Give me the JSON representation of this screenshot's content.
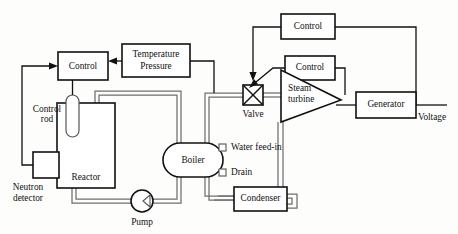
{
  "diagram": {
    "canvas": {
      "width": 458,
      "height": 234
    },
    "colors": {
      "background": "#fdfdfc",
      "line": "#111111",
      "pipe": "#6f6f6f",
      "fill": "#ffffff"
    },
    "nodes": {
      "control_reactor": {
        "label": "Control",
        "shape": "rectangle"
      },
      "temperature_pressure": {
        "label": "Temperature\nPressure",
        "line1": "Temperature",
        "line2": "Pressure",
        "shape": "rectangle"
      },
      "control_top": {
        "label": "Control",
        "shape": "rectangle"
      },
      "control_valve": {
        "label": "Control",
        "shape": "rectangle"
      },
      "reactor": {
        "label": "Reactor",
        "shape": "rectangle"
      },
      "control_rod": {
        "label": "Control\nrod",
        "line1": "Control",
        "line2": "rod",
        "shape": "rounded-rod"
      },
      "neutron_detector": {
        "label": "Neutron\ndetector",
        "line1": "Neutron",
        "line2": "detector",
        "shape": "rectangle"
      },
      "pump": {
        "label": "Pump",
        "shape": "circle"
      },
      "boiler": {
        "label": "Boiler",
        "shape": "stadium"
      },
      "valve": {
        "label": "Valve",
        "shape": "square-with-x"
      },
      "steam_turbine": {
        "label": "Steam\nturbine",
        "line1": "Steam",
        "line2": "turbine",
        "shape": "triangle"
      },
      "generator": {
        "label": "Generator",
        "shape": "rectangle"
      },
      "condenser": {
        "label": "Condenser",
        "shape": "rectangle"
      },
      "water_feed_in": {
        "label": "Water feed-in",
        "shape": "port-label"
      },
      "drain": {
        "label": "Drain",
        "shape": "port-label"
      },
      "voltage": {
        "label": "Voltage",
        "shape": "terminal-label"
      }
    }
  }
}
